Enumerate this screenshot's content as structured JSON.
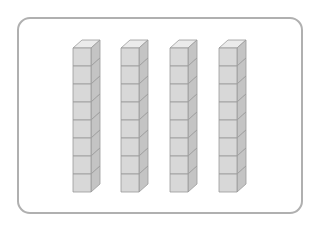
{
  "figure": {
    "stack_count": 4,
    "cubes_per_stack": 8,
    "colors": {
      "front": "#d8d8d8",
      "side": "#c4c4c4",
      "top": "#ebebeb",
      "edge": "#9a9a9a",
      "frame_border": "#b0b0b0"
    }
  },
  "stacks": [
    {
      "x": 73,
      "cubes": 8
    },
    {
      "x": 121,
      "cubes": 8
    },
    {
      "x": 170,
      "cubes": 8
    },
    {
      "x": 219,
      "cubes": 8
    }
  ]
}
